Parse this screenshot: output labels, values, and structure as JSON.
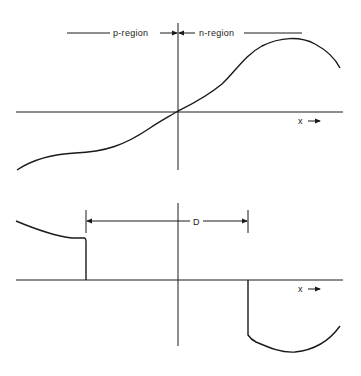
{
  "diagram": {
    "top_panel": {
      "p_region_label": "p-region",
      "n_region_label": "n-region",
      "x_axis_label": "x",
      "x_axis_arrow": "→",
      "curve": "odd S-shaped function through origin, rising to a peak in n-region and turning down"
    },
    "bottom_panel": {
      "dimension_label": "D",
      "x_axis_label": "x",
      "x_axis_arrow": "→",
      "curve": "positive step in p-region ending at left edge of D, negative step in n-region starting at right edge of D"
    },
    "colors": {
      "line": "#1a1a1a",
      "background": "#ffffff"
    }
  }
}
